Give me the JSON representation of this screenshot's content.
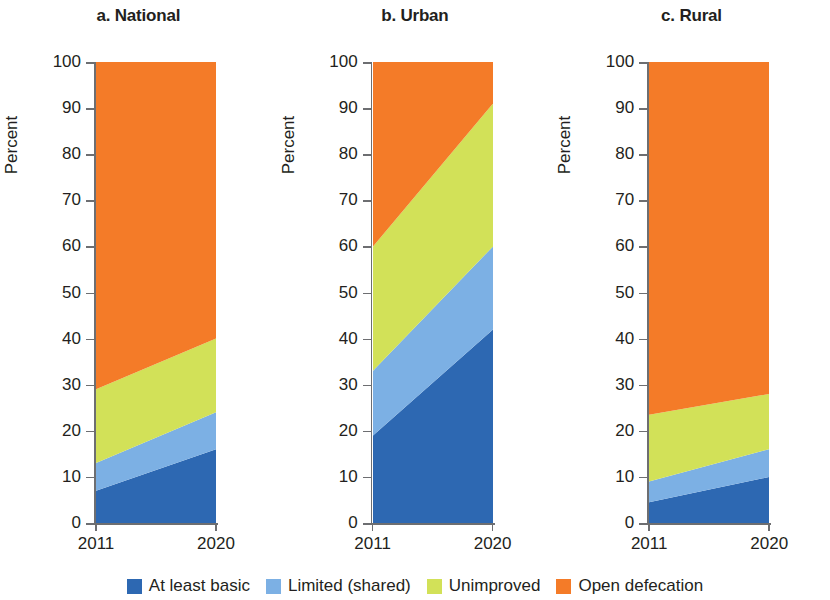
{
  "axis": {
    "ylabel": "Percent",
    "yticks": [
      0,
      10,
      20,
      30,
      40,
      50,
      60,
      70,
      80,
      90,
      100
    ],
    "xticks": [
      "2011",
      "2020"
    ]
  },
  "legend": [
    {
      "label": "At least basic",
      "color": "#2d68b2"
    },
    {
      "label": "Limited (shared)",
      "color": "#7cb0e4"
    },
    {
      "label": "Unimproved",
      "color": "#d2e158"
    },
    {
      "label": "Open defecation",
      "color": "#f47b28"
    }
  ],
  "panels": [
    {
      "title": "a. National"
    },
    {
      "title": "b. Urban"
    },
    {
      "title": "c. Rural"
    }
  ],
  "chart_data": [
    {
      "type": "area",
      "title": "a. National",
      "xlabel": "",
      "ylabel": "Percent",
      "x": [
        "2011",
        "2020"
      ],
      "ylim": [
        0,
        100
      ],
      "grid": false,
      "stacked": true,
      "legend_position": "bottom",
      "series": [
        {
          "name": "At least basic",
          "color": "#2d68b2",
          "values": [
            7,
            16
          ]
        },
        {
          "name": "Limited (shared)",
          "color": "#7cb0e4",
          "values": [
            6,
            8
          ]
        },
        {
          "name": "Unimproved",
          "color": "#d2e158",
          "values": [
            16,
            16
          ]
        },
        {
          "name": "Open defecation",
          "color": "#f47b28",
          "values": [
            71,
            60
          ]
        }
      ],
      "cumulative_tops": {
        "At least basic": [
          7,
          16
        ],
        "Limited (shared)": [
          13,
          24
        ],
        "Unimproved": [
          29,
          40
        ],
        "Open defecation": [
          100,
          100
        ]
      }
    },
    {
      "type": "area",
      "title": "b. Urban",
      "xlabel": "",
      "ylabel": "Percent",
      "x": [
        "2011",
        "2020"
      ],
      "ylim": [
        0,
        100
      ],
      "grid": false,
      "stacked": true,
      "legend_position": "bottom",
      "series": [
        {
          "name": "At least basic",
          "color": "#2d68b2",
          "values": [
            19,
            42
          ]
        },
        {
          "name": "Limited (shared)",
          "color": "#7cb0e4",
          "values": [
            14,
            18
          ]
        },
        {
          "name": "Unimproved",
          "color": "#d2e158",
          "values": [
            27,
            31
          ]
        },
        {
          "name": "Open defecation",
          "color": "#f47b28",
          "values": [
            40,
            9
          ]
        }
      ],
      "cumulative_tops": {
        "At least basic": [
          19,
          42
        ],
        "Limited (shared)": [
          33,
          60
        ],
        "Unimproved": [
          60,
          91
        ],
        "Open defecation": [
          100,
          100
        ]
      }
    },
    {
      "type": "area",
      "title": "c. Rural",
      "xlabel": "",
      "ylabel": "Percent",
      "x": [
        "2011",
        "2020"
      ],
      "ylim": [
        0,
        100
      ],
      "grid": false,
      "stacked": true,
      "legend_position": "bottom",
      "series": [
        {
          "name": "At least basic",
          "color": "#2d68b2",
          "values": [
            4.5,
            10
          ]
        },
        {
          "name": "Limited (shared)",
          "color": "#7cb0e4",
          "values": [
            4.5,
            6
          ]
        },
        {
          "name": "Unimproved",
          "color": "#d2e158",
          "values": [
            14.5,
            12
          ]
        },
        {
          "name": "Open defecation",
          "color": "#f47b28",
          "values": [
            76.5,
            72
          ]
        }
      ],
      "cumulative_tops": {
        "At least basic": [
          4.5,
          10
        ],
        "Limited (shared)": [
          9,
          16
        ],
        "Unimproved": [
          23.5,
          28
        ],
        "Open defecation": [
          100,
          100
        ]
      }
    }
  ]
}
